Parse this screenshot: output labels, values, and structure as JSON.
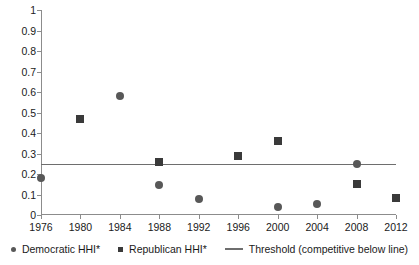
{
  "chart_data": {
    "type": "scatter",
    "title": "",
    "xlabel": "",
    "ylabel": "",
    "x": [
      1976,
      1980,
      1984,
      1988,
      1992,
      1996,
      2000,
      2004,
      2008,
      2012
    ],
    "xlim": [
      1976,
      2012
    ],
    "ylim": [
      0,
      1
    ],
    "ytick_step": 0.1,
    "grid": false,
    "legend_position": "bottom",
    "xticklabels": [
      "1976",
      "1980",
      "1984",
      "1988",
      "1992",
      "1996",
      "2000",
      "2004",
      "2008",
      "2012"
    ],
    "yticklabels": [
      "0",
      "0.1",
      "0.2",
      "0.3",
      "0.4",
      "0.5",
      "0.6",
      "0.7",
      "0.8",
      "0.9",
      "1"
    ],
    "series": [
      {
        "name": "Democratic HHI*",
        "marker": "circle",
        "color": "#585858",
        "points": [
          {
            "x": 1976,
            "y": 0.18
          },
          {
            "x": 1984,
            "y": 0.58
          },
          {
            "x": 1988,
            "y": 0.145
          },
          {
            "x": 1992,
            "y": 0.08
          },
          {
            "x": 2000,
            "y": 0.04
          },
          {
            "x": 2004,
            "y": 0.053
          },
          {
            "x": 2008,
            "y": 0.247
          }
        ]
      },
      {
        "name": "Republican HHI*",
        "marker": "square",
        "color": "#3a3a3a",
        "points": [
          {
            "x": 1980,
            "y": 0.47
          },
          {
            "x": 1988,
            "y": 0.26
          },
          {
            "x": 1996,
            "y": 0.29
          },
          {
            "x": 2000,
            "y": 0.36
          },
          {
            "x": 2008,
            "y": 0.152
          },
          {
            "x": 2012,
            "y": 0.085
          }
        ]
      }
    ],
    "threshold": {
      "name": "Threshold (competitive below line)",
      "value": 0.25,
      "color": "#6e6e6e"
    }
  },
  "legend": {
    "items": [
      {
        "label": "Democratic HHI*",
        "marker": "circle"
      },
      {
        "label": "Republican HHI*",
        "marker": "square"
      },
      {
        "label": "Threshold (competitive below line)",
        "marker": "line"
      }
    ]
  }
}
